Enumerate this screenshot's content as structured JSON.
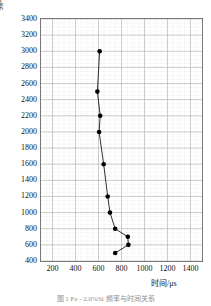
{
  "figure": {
    "caption": "图 1  Fe - 2.0%Si 频率与时间关系"
  },
  "axes": {
    "y_title": "频率/Hz",
    "x_title": "时间/μs",
    "y_ticks": [
      3400,
      3200,
      3000,
      2800,
      2600,
      2400,
      2200,
      2000,
      1800,
      1600,
      1400,
      1200,
      1000,
      800,
      600,
      400
    ],
    "x_ticks": [
      200,
      400,
      600,
      800,
      1000,
      1200,
      1400
    ],
    "grid": "major and minor dotted",
    "frame_color": "#7a7a7a",
    "grid_major_color": "#b9b9b9",
    "grid_minor_color": "#d8d8d8",
    "line_color": "#1a1a1a",
    "marker_color": "#000000"
  },
  "chart_data": {
    "type": "line",
    "title": "",
    "xlabel": "时间/μs",
    "ylabel": "频率/Hz",
    "xlim": [
      100,
      1500
    ],
    "ylim": [
      400,
      3400
    ],
    "grid": true,
    "legend": null,
    "series": [
      {
        "name": "frequency-vs-time",
        "x": [
          610,
          590,
          615,
          605,
          645,
          680,
          700,
          745,
          855,
          860,
          745
        ],
        "y": [
          3000,
          2500,
          2200,
          2000,
          1600,
          1200,
          1000,
          800,
          700,
          600,
          500
        ],
        "marker": "filled-circle"
      }
    ]
  }
}
